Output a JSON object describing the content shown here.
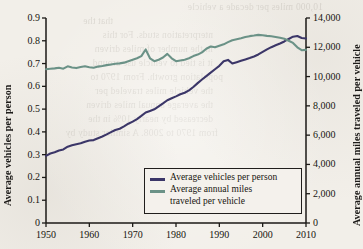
{
  "chart_data": {
    "type": "line",
    "title": "",
    "xlabel": "",
    "ylabel": "Average vehicles per person",
    "y2label": "Average annual miles traveled per vehicle",
    "xlim": [
      1950,
      2010
    ],
    "ylim": [
      0,
      0.9
    ],
    "y2lim": [
      0,
      14000
    ],
    "grid": false,
    "legend_position": "bottom-center-inside",
    "x_ticks": [
      "1950",
      "1960",
      "1970",
      "1980",
      "1990",
      "2000",
      "2010"
    ],
    "x_tick_values": [
      1950,
      1960,
      1970,
      1980,
      1990,
      2000,
      2010
    ],
    "y_ticks": [
      "0",
      "0.1",
      "0.2",
      "0.3",
      "0.4",
      "0.5",
      "0.6",
      "0.7",
      "0.8",
      "0.9"
    ],
    "y_tick_values": [
      0,
      0.1,
      0.2,
      0.3,
      0.4,
      0.5,
      0.6,
      0.7,
      0.8,
      0.9
    ],
    "y2_ticks": [
      "0",
      "2,000",
      "4,000",
      "6,000",
      "8,000",
      "10,000",
      "12,000",
      "14,000"
    ],
    "y2_tick_values": [
      0,
      2000,
      4000,
      6000,
      8000,
      10000,
      12000,
      14000
    ],
    "series": [
      {
        "name": "Average vehicles per person",
        "color": "#3b3668",
        "axis": "left",
        "x": [
          1950,
          1951,
          1952,
          1953,
          1954,
          1955,
          1956,
          1957,
          1958,
          1959,
          1960,
          1961,
          1962,
          1963,
          1964,
          1965,
          1966,
          1967,
          1968,
          1969,
          1970,
          1971,
          1972,
          1973,
          1974,
          1975,
          1976,
          1977,
          1978,
          1979,
          1980,
          1981,
          1982,
          1983,
          1984,
          1985,
          1986,
          1987,
          1988,
          1989,
          1990,
          1991,
          1992,
          1993,
          1994,
          1995,
          1996,
          1997,
          1998,
          1999,
          2000,
          2001,
          2002,
          2003,
          2004,
          2005,
          2006,
          2007,
          2008,
          2009,
          2010
        ],
        "values": [
          0.295,
          0.305,
          0.311,
          0.318,
          0.323,
          0.335,
          0.341,
          0.346,
          0.35,
          0.357,
          0.362,
          0.364,
          0.372,
          0.38,
          0.389,
          0.399,
          0.408,
          0.414,
          0.424,
          0.436,
          0.445,
          0.456,
          0.47,
          0.485,
          0.492,
          0.499,
          0.512,
          0.525,
          0.539,
          0.548,
          0.556,
          0.565,
          0.572,
          0.582,
          0.597,
          0.614,
          0.63,
          0.645,
          0.66,
          0.675,
          0.69,
          0.71,
          0.716,
          0.7,
          0.706,
          0.712,
          0.718,
          0.724,
          0.731,
          0.74,
          0.751,
          0.762,
          0.772,
          0.78,
          0.788,
          0.797,
          0.808,
          0.818,
          0.821,
          0.812,
          0.81
        ]
      },
      {
        "name": "Average annual miles traveled per vehicle",
        "color": "#6b9287",
        "axis": "right",
        "x": [
          1950,
          1951,
          1952,
          1953,
          1954,
          1955,
          1956,
          1957,
          1958,
          1959,
          1960,
          1961,
          1962,
          1963,
          1964,
          1965,
          1966,
          1967,
          1968,
          1969,
          1970,
          1971,
          1972,
          1973,
          1974,
          1975,
          1976,
          1977,
          1978,
          1979,
          1980,
          1981,
          1982,
          1983,
          1984,
          1985,
          1986,
          1987,
          1988,
          1989,
          1990,
          1991,
          1992,
          1993,
          1994,
          1995,
          1996,
          1997,
          1998,
          1999,
          2000,
          2001,
          2002,
          2003,
          2004,
          2005,
          2006,
          2007,
          2008,
          2009,
          2010
        ],
        "values": [
          10500,
          10530,
          10560,
          10600,
          10540,
          10700,
          10620,
          10580,
          10650,
          10700,
          10640,
          10600,
          10680,
          10720,
          10780,
          10830,
          10880,
          10900,
          10950,
          11050,
          11150,
          11250,
          11400,
          11850,
          11250,
          11050,
          11150,
          11300,
          11550,
          11250,
          11050,
          11100,
          11150,
          11250,
          11400,
          11500,
          11650,
          11900,
          12050,
          12000,
          12100,
          12200,
          12350,
          12480,
          12550,
          12620,
          12700,
          12760,
          12800,
          12850,
          12820,
          12780,
          12750,
          12700,
          12650,
          12580,
          12450,
          12300,
          12000,
          11800,
          11820
        ]
      }
    ]
  },
  "legend": {
    "items": [
      {
        "label": "Average vehicles per person",
        "label_line2": "",
        "color": "#3b3668"
      },
      {
        "label": "Average annual miles",
        "label_line2": "traveled per vehicle",
        "color": "#6b9287"
      }
    ]
  },
  "bleed_through_text": [
    "10,000 miles per decade a vehicle",
    "that the",
    "nterpretation studs. For this",
    "in the number of miles driven",
    "it is tied to vehicle use around",
    "population growth. From 1970 to",
    "the vehicle miles traveled per",
    "the average annual miles driven",
    "decreased by nearly 10% in the",
    "from 1970 to 2008. A similar study by"
  ]
}
